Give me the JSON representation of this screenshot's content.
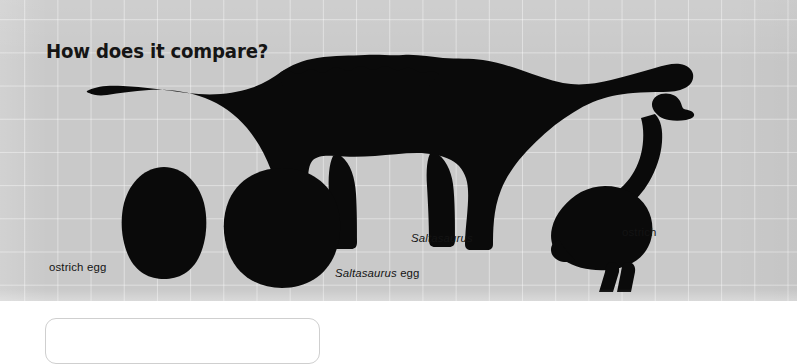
{
  "panel": {
    "title": "How does it compare?",
    "background_color": "#c9c9c9",
    "grid_line_color": "#d6d6d6",
    "silhouette_color": "#0a0a0a"
  },
  "figures": [
    {
      "id": "saltasaurus",
      "icon": "saltasaurus-silhouette",
      "label_plain": "",
      "label_scientific": "Saltasaurus",
      "label_suffix": ""
    },
    {
      "id": "ostrich",
      "icon": "ostrich-silhouette",
      "label_plain": "ostrich",
      "label_scientific": "",
      "label_suffix": ""
    },
    {
      "id": "ostrich-egg",
      "icon": "ostrich-egg-silhouette",
      "label_plain": "ostrich egg",
      "label_scientific": "",
      "label_suffix": ""
    },
    {
      "id": "saltasaurus-egg",
      "icon": "saltasaurus-egg-silhouette",
      "label_plain": "",
      "label_scientific": "Saltasaurus",
      "label_suffix": " egg"
    }
  ],
  "labels": {
    "ostrich_egg": "ostrich egg",
    "saltasaurus_egg_genus": "Saltasaurus",
    "saltasaurus_egg_suffix": " egg",
    "saltasaurus": "Saltasaurus",
    "ostrich": "ostrich"
  }
}
